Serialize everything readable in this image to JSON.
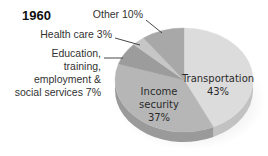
{
  "chart_data": {
    "type": "pie",
    "title": "1960",
    "style": "3d-tilted",
    "start": "top",
    "direction": "clockwise",
    "slices": [
      {
        "name": "Transportation",
        "value": 43,
        "label_lines": [
          "Transportation",
          "43%"
        ],
        "label_position": "inside",
        "color": "#dcdcdc",
        "side_color": "#c2c2c2"
      },
      {
        "name": "Income security",
        "value": 37,
        "label_lines": [
          "Income",
          "security",
          "37%"
        ],
        "label_position": "inside",
        "color": "#b6b6b6",
        "side_color": "#9a9a9a"
      },
      {
        "name": "Education, training, employment & social services",
        "value": 7,
        "label_lines": [
          "Education,",
          "training,",
          "employment &",
          "social services 7%"
        ],
        "label_position": "outside-left",
        "color": "#9c9c9c",
        "side_color": "#858585"
      },
      {
        "name": "Health care",
        "value": 3,
        "label_lines": [
          "Health care 3%"
        ],
        "label_position": "outside-left",
        "color": "#c6c6c6",
        "side_color": "#aaaaaa"
      },
      {
        "name": "Other",
        "value": 10,
        "label_lines": [
          "Other 10%"
        ],
        "label_position": "outside-top",
        "color": "#a8a8a8",
        "side_color": "#8e8e8e"
      }
    ],
    "legend": "none",
    "unit": "%"
  }
}
